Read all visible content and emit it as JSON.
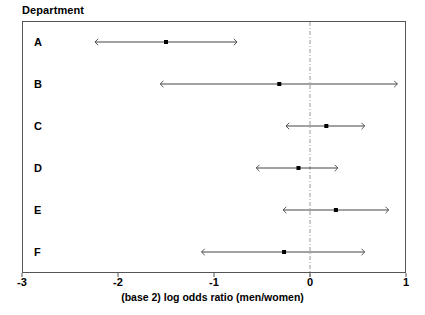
{
  "chart_data": {
    "type": "scatter",
    "title": "Department",
    "xlabel": "(base 2) log odds ratio (men/women)",
    "ylabel": "Department",
    "xlim": [
      -3,
      1
    ],
    "xticks": [
      -3,
      -2,
      -1,
      0,
      1
    ],
    "xticklabels": [
      "-3",
      "-2",
      "-1",
      "0",
      "1"
    ],
    "grid": false,
    "legend": null,
    "reference_line": {
      "x": 0,
      "style": "dash-dot",
      "color": "#888888"
    },
    "categories": [
      "A",
      "B",
      "C",
      "D",
      "E",
      "F"
    ],
    "series": [
      {
        "name": "(base 2) log odds ratio with confidence interval",
        "points": [
          {
            "category": "A",
            "estimate": -1.5,
            "low": -2.24,
            "high": -0.76
          },
          {
            "category": "B",
            "estimate": -0.32,
            "low": -1.56,
            "high": 0.91
          },
          {
            "category": "C",
            "estimate": 0.17,
            "low": -0.25,
            "high": 0.57
          },
          {
            "category": "D",
            "estimate": -0.12,
            "low": -0.56,
            "high": 0.29
          },
          {
            "category": "E",
            "estimate": 0.27,
            "low": -0.28,
            "high": 0.82
          },
          {
            "category": "F",
            "estimate": -0.27,
            "low": -1.13,
            "high": 0.57
          }
        ]
      }
    ],
    "marker": {
      "shape": "square",
      "color": "#000000",
      "size": 4
    },
    "interval_line": {
      "color": "#444444",
      "width": 1,
      "arrow_caps": true
    }
  },
  "colors": {
    "frame": "#555555",
    "line": "#444444",
    "marker": "#000000",
    "reference": "#999999",
    "text": "#000000",
    "background": "#ffffff"
  }
}
